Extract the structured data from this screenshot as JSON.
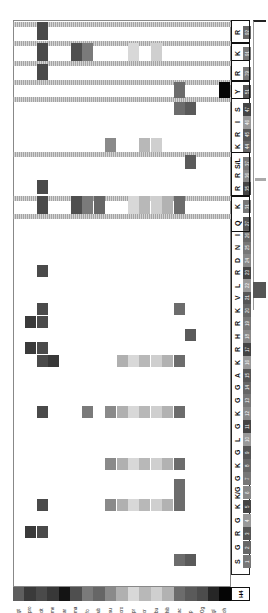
{
  "chart_data": {
    "type": "heatmap",
    "orientation": "rotated 90° (residues along vertical axis, modifications along horizontal axis)",
    "protein_label": "H4",
    "modifications": [
      "gt",
      "pro",
      "cit",
      "me",
      "ar",
      "ma",
      "fo",
      "ub",
      "su",
      "cro",
      "pr",
      "cr",
      "bu",
      "hib",
      "ac",
      "p",
      "Og",
      "gl",
      "oh"
    ],
    "modification_colors": {
      "gt": "#5e5e5e",
      "pro": "#3a3a3a",
      "cit": "#4a4a4a",
      "me": "#383838",
      "ar": "#141414",
      "ma": "#4f4f4f",
      "fo": "#7a7a7a",
      "ub": "#666666",
      "su": "#8a8a8a",
      "cro": "#b0b0b0",
      "pr": "#d8d8d8",
      "cr": "#b8b8b8",
      "bu": "#cfcfcf",
      "hib": "#b2b2b2",
      "ac": "#6c6c6c",
      "p": "#5a5a5a",
      "Og": "#4c4c4c",
      "gl": "#262626",
      "oh": "#050505"
    },
    "residues": [
      {
        "aa": "S",
        "pos": "1",
        "mods": [
          "ac",
          "p"
        ]
      },
      {
        "aa": "G",
        "pos": "2",
        "mods": []
      },
      {
        "aa": "R",
        "pos": "3",
        "mods": [
          "pro",
          "cit"
        ]
      },
      {
        "aa": "G",
        "pos": "4",
        "mods": []
      },
      {
        "aa": "K",
        "pos": "5",
        "mods": [
          "cit",
          "su",
          "cro",
          "pr",
          "cr",
          "bu",
          "hib",
          "ac"
        ]
      },
      {
        "aa": "K/G",
        "pos": "6",
        "mods": [
          "ac"
        ],
        "note": "ac variant"
      },
      {
        "aa": "G",
        "pos": "7",
        "mods": []
      },
      {
        "aa": "K",
        "pos": "8",
        "mods": [
          "su",
          "cro",
          "pr",
          "cr",
          "bu",
          "hib",
          "ac"
        ]
      },
      {
        "aa": "G",
        "pos": "9",
        "mods": []
      },
      {
        "aa": "L",
        "pos": "10",
        "mods": []
      },
      {
        "aa": "G",
        "pos": "11",
        "mods": []
      },
      {
        "aa": "K",
        "pos": "12",
        "mods": [
          "cit",
          "fo",
          "su",
          "cro",
          "pr",
          "cr",
          "bu",
          "hib",
          "ac"
        ]
      },
      {
        "aa": "G",
        "pos": "13",
        "mods": []
      },
      {
        "aa": "G",
        "pos": "14",
        "mods": []
      },
      {
        "aa": "A",
        "pos": "15",
        "mods": []
      },
      {
        "aa": "K",
        "pos": "16",
        "mods": [
          "cit",
          "me",
          "cro",
          "pr",
          "cr",
          "bu",
          "hib",
          "ac"
        ]
      },
      {
        "aa": "R",
        "pos": "17",
        "mods": [
          "pro",
          "cit"
        ]
      },
      {
        "aa": "H",
        "pos": "18",
        "mods": [
          "p"
        ]
      },
      {
        "aa": "R",
        "pos": "19",
        "mods": [
          "pro",
          "cit"
        ]
      },
      {
        "aa": "K",
        "pos": "20",
        "mods": [
          "cit",
          "ac"
        ]
      },
      {
        "aa": "V",
        "pos": "21",
        "mods": []
      },
      {
        "aa": "L",
        "pos": "22",
        "mods": []
      },
      {
        "aa": "R",
        "pos": "23",
        "mods": [
          "cit"
        ]
      },
      {
        "aa": "D",
        "pos": "24",
        "mods": []
      },
      {
        "aa": "N",
        "pos": "25",
        "mods": []
      },
      {
        "aa": "I",
        "pos": "26",
        "mods": []
      },
      {
        "aa": "Q",
        "pos": "27",
        "mods": []
      },
      {
        "aa": "K",
        "pos": "31",
        "mods": [
          "cit",
          "ma",
          "fo",
          "ub",
          "pr",
          "cr",
          "bu",
          "hib",
          "ac"
        ]
      },
      {
        "aa": "R",
        "pos": "35",
        "mods": [
          "cit"
        ]
      },
      {
        "aa": "R",
        "pos": "36",
        "mods": []
      },
      {
        "aa": "S/L",
        "pos": "37",
        "mods": [
          "p"
        ]
      },
      {
        "aa": "K",
        "pos": "44",
        "mods": [
          "su",
          "cr",
          "bu"
        ]
      },
      {
        "aa": "R",
        "pos": "45",
        "mods": []
      },
      {
        "aa": "I",
        "pos": "46",
        "mods": []
      },
      {
        "aa": "S",
        "pos": "47",
        "mods": [
          "ac",
          "p"
        ]
      },
      {
        "aa": "Y",
        "pos": "51",
        "mods": [
          "ac",
          "oh"
        ]
      },
      {
        "aa": "R",
        "pos": "79",
        "mods": [
          "cit"
        ]
      },
      {
        "aa": "K",
        "pos": "91",
        "mods": [
          "cit",
          "ma",
          "fo",
          "pr",
          "bu"
        ]
      },
      {
        "aa": "R",
        "pos": "92",
        "mods": [
          "cit"
        ]
      }
    ]
  },
  "legend": {
    "labels": [
      "gt",
      "pro",
      "cit",
      "me",
      "ar",
      "ma",
      "fo",
      "ub",
      "su",
      "cro",
      "pr",
      "cr",
      "bu",
      "hib",
      "ac",
      "p",
      "Og",
      "gl",
      "oh"
    ],
    "h4_label": "H4"
  }
}
